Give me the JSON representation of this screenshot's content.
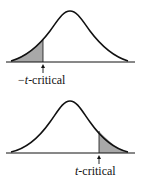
{
  "panels": [
    {
      "label_prefix": "−",
      "label_var": "t",
      "label_suffix": "-critical",
      "tail": "left"
    },
    {
      "label_prefix": "",
      "label_var": "t",
      "label_suffix": "-critical",
      "tail": "right"
    }
  ],
  "colors": {
    "curve": "#111111",
    "shade": "#a8a8a8"
  }
}
